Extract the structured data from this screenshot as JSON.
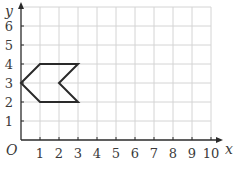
{
  "chart_data": {
    "type": "diagram",
    "title": "",
    "xlabel": "x",
    "ylabel": "y",
    "origin_label": "O",
    "xlim": [
      0,
      10
    ],
    "ylim": [
      0,
      7
    ],
    "x_ticks": [
      1,
      2,
      3,
      4,
      5,
      6,
      7,
      8,
      9,
      10
    ],
    "y_ticks": [
      1,
      2,
      3,
      4,
      5,
      6
    ],
    "x_tick_labels": [
      "1",
      "2",
      "3",
      "4",
      "5",
      "6",
      "7",
      "8",
      "9",
      "10"
    ],
    "y_tick_labels": [
      "1",
      "2",
      "3",
      "4",
      "5",
      "6"
    ],
    "grid": true,
    "shape": {
      "name": "arrow-hexagon",
      "vertices": [
        [
          0,
          3
        ],
        [
          1,
          4
        ],
        [
          3,
          4
        ],
        [
          2,
          3
        ],
        [
          3,
          2
        ],
        [
          1,
          2
        ]
      ],
      "closed": true
    },
    "colors": {
      "grid": "#d4d4d4",
      "axis": "#2a2a2a",
      "shape": "#2a2a2a"
    }
  }
}
